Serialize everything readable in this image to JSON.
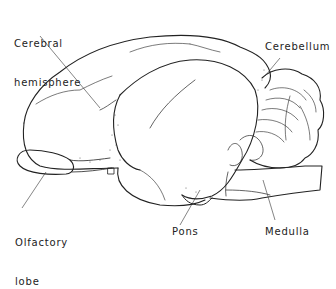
{
  "figure": {
    "labels": {
      "cerebral_hemisphere_line1": "Cerebral",
      "cerebral_hemisphere_line2": "hemisphere",
      "cerebellum": "Cerebellum",
      "olfactory_lobe_line1": "Olfactory",
      "olfactory_lobe_line2": "lobe",
      "pons": "Pons",
      "medulla": "Medulla"
    },
    "colors": {
      "ink": "#222222",
      "background": "#ffffff"
    }
  }
}
